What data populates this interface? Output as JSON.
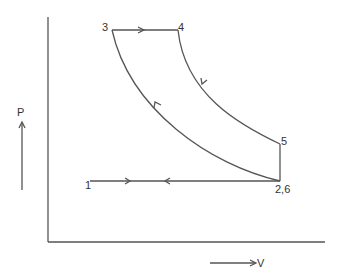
{
  "diagram": {
    "type": "pv-cycle",
    "axis_labels": {
      "y": "P",
      "x": "V"
    },
    "points": [
      {
        "id": "1",
        "label": "1",
        "x": 90,
        "y": 181
      },
      {
        "id": "2,6",
        "label": "2,6",
        "x": 280,
        "y": 181
      },
      {
        "id": "3",
        "label": "3",
        "x": 112,
        "y": 30
      },
      {
        "id": "4",
        "label": "4",
        "x": 178,
        "y": 30
      },
      {
        "id": "5",
        "label": "5",
        "x": 280,
        "y": 144
      }
    ],
    "processes": [
      {
        "from": "1",
        "to": "2,6",
        "kind": "horizontal",
        "arrow": "right"
      },
      {
        "from": "2,6",
        "to": "3",
        "kind": "compression-curve",
        "arrow": "up-left"
      },
      {
        "from": "3",
        "to": "4",
        "kind": "constant-pressure",
        "arrow": "right"
      },
      {
        "from": "4",
        "to": "5",
        "kind": "expansion-curve",
        "arrow": "down-right"
      },
      {
        "from": "5",
        "to": "2,6",
        "kind": "constant-volume",
        "arrow": "none"
      },
      {
        "from": "2,6",
        "to": "1",
        "kind": "horizontal",
        "arrow": "left"
      }
    ],
    "colors": {
      "line": "#555555",
      "text": "#333333",
      "background": "#ffffff"
    }
  }
}
